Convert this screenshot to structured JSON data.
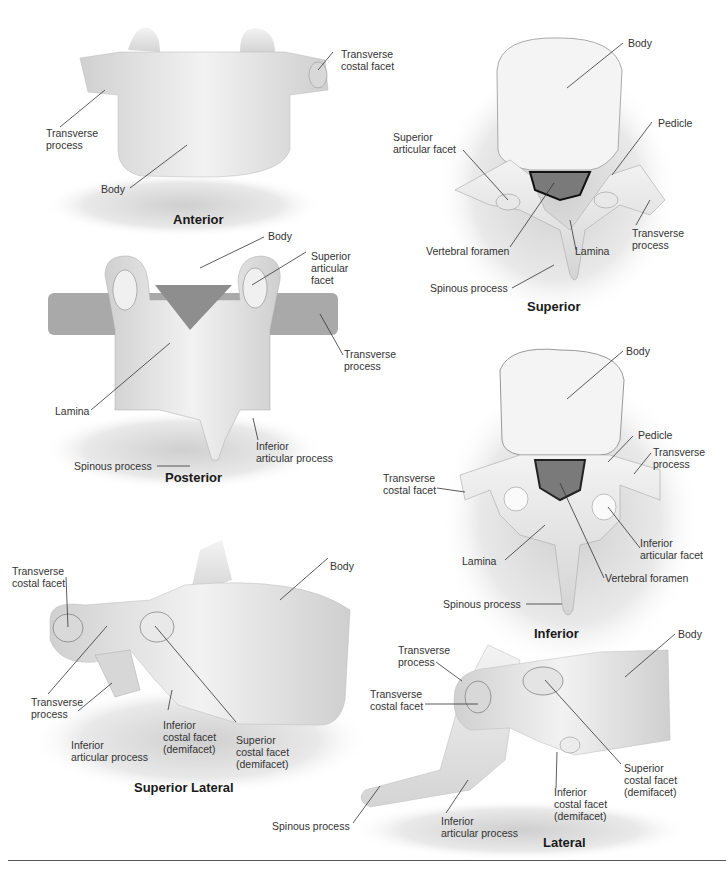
{
  "figure": {
    "views": [
      {
        "id": "anterior",
        "title": "Anterior",
        "labels": [
          "Transverse costal facet",
          "Transverse process",
          "Body"
        ]
      },
      {
        "id": "superior",
        "title": "Superior",
        "labels": [
          "Body",
          "Superior articular facet",
          "Pedicle",
          "Transverse process",
          "Vertebral foramen",
          "Lamina",
          "Spinous process"
        ]
      },
      {
        "id": "posterior",
        "title": "Posterior",
        "labels": [
          "Body",
          "Superior articular facet",
          "Transverse process",
          "Lamina",
          "Inferior articular process",
          "Spinous process"
        ]
      },
      {
        "id": "inferior",
        "title": "Inferior",
        "labels": [
          "Body",
          "Pedicle",
          "Transverse process",
          "Transverse costal facet",
          "Inferior articular facet",
          "Lamina",
          "Vertebral foramen",
          "Spinous process"
        ]
      },
      {
        "id": "superior-lateral",
        "title": "Superior Lateral",
        "labels": [
          "Transverse costal facet",
          "Body",
          "Transverse process",
          "Inferior articular process",
          "Inferior costal facet (demifacet)",
          "Superior costal facet (demifacet)"
        ]
      },
      {
        "id": "lateral",
        "title": "Lateral",
        "labels": [
          "Body",
          "Transverse process",
          "Transverse costal facet",
          "Superior costal facet (demifacet)",
          "Inferior costal facet (demifacet)",
          "Spinous process",
          "Inferior articular process"
        ]
      }
    ]
  },
  "text": {
    "ant_title": "Anterior",
    "ant_tcf": "Transverse\ncostal facet",
    "ant_tp": "Transverse\nprocess",
    "ant_body": "Body",
    "sup_title": "Superior",
    "sup_body": "Body",
    "sup_saf": "Superior\narticular facet",
    "sup_pedicle": "Pedicle",
    "sup_tp": "Transverse\nprocess",
    "sup_vf": "Vertebral foramen",
    "sup_lamina": "Lamina",
    "sup_sp": "Spinous process",
    "post_title": "Posterior",
    "post_body": "Body",
    "post_saf": "Superior\narticular\nfacet",
    "post_tp": "Transverse\nprocess",
    "post_lamina": "Lamina",
    "post_iap": "Inferior\narticular process",
    "post_sp": "Spinous process",
    "inf_title": "Inferior",
    "inf_body": "Body",
    "inf_pedicle": "Pedicle",
    "inf_tp": "Transverse\nprocess",
    "inf_tcf": "Transverse\ncostal facet",
    "inf_iaf": "Inferior\narticular facet",
    "inf_lamina": "Lamina",
    "inf_vf": "Vertebral foramen",
    "inf_sp": "Spinous process",
    "sl_title": "Superior Lateral",
    "sl_tcf": "Transverse\ncostal facet",
    "sl_body": "Body",
    "sl_tp": "Transverse\nprocess",
    "sl_iap": "Inferior\narticular process",
    "sl_icf": "Inferior\ncostal facet\n(demifacet)",
    "sl_scf": "Superior\ncostal facet\n(demifacet)",
    "lat_title": "Lateral",
    "lat_body": "Body",
    "lat_tp": "Transverse\nprocess",
    "lat_tcf": "Transverse\ncostal facet",
    "lat_scf": "Superior\ncostal facet\n(demifacet)",
    "lat_icf": "Inferior\ncostal facet\n(demifacet)",
    "lat_sp": "Spinous process",
    "lat_iap": "Inferior\narticular process"
  },
  "colors": {
    "background": "#ffffff",
    "bone": "#ebebeb",
    "bone_shade": "#c9c9c9",
    "shadow": "#d8d8d8",
    "foramen": "#7a7a7a",
    "leader_line": "#333333"
  }
}
